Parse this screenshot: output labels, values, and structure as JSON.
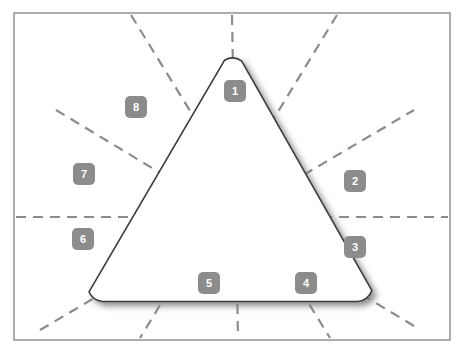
{
  "figure": {
    "title": "",
    "type": "geometry-diagram",
    "canvas": {
      "width": 464,
      "height": 352,
      "background_color": "#ffffff",
      "border_color": "#8a8a8a",
      "border_rect": {
        "x": 14,
        "y": 13,
        "width": 436,
        "height": 327
      }
    },
    "shape": {
      "name": "rounded-triangle",
      "stroke_color": "#3a3a3a",
      "fill_color": "#ffffff",
      "stroke_width": 1.6,
      "corner_radius": 16,
      "shadow_color": "#9a9a9a",
      "vertices": [
        {
          "label": "apex",
          "x": 232,
          "y": 46
        },
        {
          "label": "bottom-right",
          "x": 366,
          "y": 301
        },
        {
          "label": "bottom-left",
          "x": 96,
          "y": 301
        }
      ]
    },
    "center_point": {
      "x": 235,
      "y": 218
    },
    "dashed_lines": {
      "color": "#8c8c8c",
      "stroke_width": 2.2,
      "dash_pattern": "10 7",
      "count": 6,
      "lines": [
        {
          "name": "horizontal",
          "x1": 16,
          "y1": 217,
          "x2": 448,
          "y2": 217
        },
        {
          "name": "steep-down-right",
          "x1": 131,
          "y1": 15,
          "x2": 330,
          "y2": 338
        },
        {
          "name": "steep-down-left",
          "x1": 337,
          "y1": 15,
          "x2": 140,
          "y2": 338
        },
        {
          "name": "shallow-up-right",
          "x1": 56,
          "y1": 110,
          "x2": 414,
          "y2": 326
        },
        {
          "name": "shallow-down-right",
          "x1": 40,
          "y1": 330,
          "x2": 414,
          "y2": 110
        },
        {
          "name": "vertical-axis",
          "x1": 232,
          "y1": 15,
          "x2": 238,
          "y2": 338
        }
      ]
    },
    "badges": [
      {
        "label": "1",
        "x": 224,
        "y": 80
      },
      {
        "label": "2",
        "x": 344,
        "y": 170
      },
      {
        "label": "3",
        "x": 344,
        "y": 236
      },
      {
        "label": "4",
        "x": 295,
        "y": 272
      },
      {
        "label": "5",
        "x": 198,
        "y": 272
      },
      {
        "label": "6",
        "x": 72,
        "y": 228
      },
      {
        "label": "7",
        "x": 73,
        "y": 163
      },
      {
        "label": "8",
        "x": 125,
        "y": 96
      }
    ],
    "colors": {
      "badge_fill": "#8c8c8c",
      "badge_text": "#ffffff",
      "dash": "#8c8c8c",
      "outline": "#3a3a3a",
      "frame": "#8a8a8a"
    }
  }
}
